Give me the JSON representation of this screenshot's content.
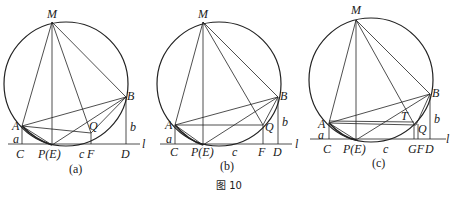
{
  "figure_caption": "图 10",
  "panels": [
    {
      "id": "a",
      "caption": "(a)",
      "labels": {
        "M": "M",
        "A": "A",
        "B": "B",
        "Q": "Q",
        "C": "C",
        "P": "P(E)",
        "c": "c",
        "F": "F",
        "D": "D",
        "a": "a",
        "b": "b",
        "l": "l"
      }
    },
    {
      "id": "b",
      "caption": "(b)",
      "labels": {
        "M": "M",
        "A": "A",
        "B": "B",
        "Q": "Q",
        "C": "C",
        "P": "P(E)",
        "c": "c",
        "F": "F",
        "D": "D",
        "a": "a",
        "b": "b",
        "l": "l"
      }
    },
    {
      "id": "c",
      "caption": "(c)",
      "labels": {
        "M": "M",
        "A": "A",
        "B": "B",
        "Q": "Q",
        "T": "T",
        "C": "C",
        "P": "P(E)",
        "c": "c",
        "GF": "GF",
        "D": "D",
        "a": "a",
        "b": "b",
        "l": "l"
      }
    }
  ]
}
